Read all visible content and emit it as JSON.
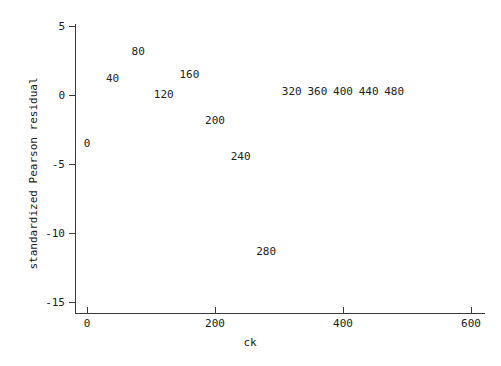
{
  "chart_data": {
    "type": "scatter",
    "title": "",
    "xlabel": "ck",
    "ylabel": "standardized Pearson residual",
    "xlim": [
      -30,
      640
    ],
    "ylim": [
      -15.8,
      5.9
    ],
    "grid": false,
    "legend": "none",
    "point_marker": "text-label",
    "x": [
      0,
      40,
      80,
      120,
      160,
      200,
      240,
      280,
      320,
      360,
      400,
      440,
      480
    ],
    "y": [
      -3.5,
      1.2,
      3.2,
      0.1,
      1.5,
      -1.8,
      -4.4,
      -11.3,
      0.3,
      0.3,
      0.3,
      0.3,
      0.3
    ],
    "point_labels": [
      "0",
      "40",
      "80",
      "120",
      "160",
      "200",
      "240",
      "280",
      "320",
      "360",
      "400",
      "440",
      "480"
    ],
    "xticks": [
      0,
      200,
      400,
      600
    ],
    "xtick_labels": [
      "0",
      "200",
      "400",
      "600"
    ],
    "yticks": [
      5,
      0,
      -5,
      -10,
      -15
    ],
    "ytick_labels": [
      "5",
      "0",
      "-5",
      "-10",
      "-15"
    ]
  },
  "axes": {
    "x_title": "ck",
    "y_title": "standardized Pearson residual"
  }
}
